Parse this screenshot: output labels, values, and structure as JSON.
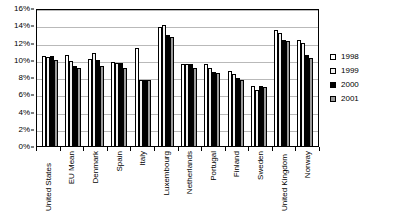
{
  "chart_data": {
    "type": "bar",
    "title": "",
    "subtitle": "",
    "xlabel": "",
    "ylabel": "",
    "ylim": [
      0,
      16
    ],
    "ytick_step": 2,
    "ytick_labels": [
      "0%",
      "2%",
      "4%",
      "6%",
      "8%",
      "10%",
      "12%",
      "14%",
      "16%"
    ],
    "grid": true,
    "legend_position": "right",
    "categories": [
      "United States",
      "EU Mean",
      "Denmark",
      "Spain",
      "Italy",
      "Luxembourg",
      "Netherlands",
      "Portugal",
      "Finland",
      "Sweden",
      "United Kingdom",
      "Norway"
    ],
    "series": [
      {
        "name": "1998",
        "color": "#ffffff",
        "values": [
          10.4,
          10.6,
          10.1,
          9.7,
          11.4,
          13.8,
          9.5,
          9.5,
          8.7,
          7.0,
          13.4,
          12.3
        ]
      },
      {
        "name": "1999",
        "color": "#f2f2f2",
        "values": [
          10.3,
          9.8,
          10.8,
          9.6,
          7.6,
          14.0,
          9.5,
          9.0,
          8.3,
          6.5,
          13.1,
          12.0
        ]
      },
      {
        "name": "2000",
        "color": "#000000",
        "values": [
          10.4,
          9.3,
          10.0,
          9.6,
          7.7,
          12.9,
          9.5,
          8.6,
          7.9,
          7.0,
          12.3,
          10.5
        ]
      },
      {
        "name": "2001",
        "color": "#9a9a9a",
        "values": [
          10.0,
          9.1,
          9.3,
          9.0,
          7.7,
          12.6,
          9.1,
          8.5,
          7.7,
          6.8,
          12.2,
          10.2
        ]
      }
    ]
  },
  "legend": {
    "items": [
      {
        "label": "1998",
        "key": "s1998"
      },
      {
        "label": "1999",
        "key": "s1999"
      },
      {
        "label": "2000",
        "key": "s2000"
      },
      {
        "label": "2001",
        "key": "s2001"
      }
    ]
  }
}
